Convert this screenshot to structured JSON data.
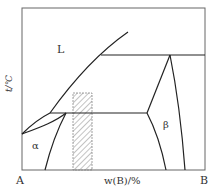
{
  "diagram": {
    "type": "binary phase diagram",
    "y_axis_label": "t/℃",
    "x_axis_label": "w(B)/%",
    "left_component": "A",
    "right_component": "B",
    "regions": {
      "liquid": "L",
      "alpha": "α",
      "beta": "β"
    },
    "colors": {
      "lines": "#222222",
      "frame": "#666666",
      "hatch": "#888888"
    }
  }
}
